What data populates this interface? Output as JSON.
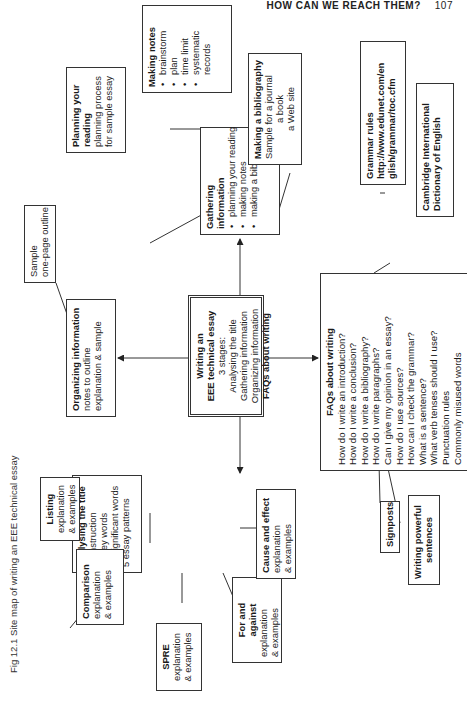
{
  "page_header": {
    "title": "HOW CAN WE REACH THEM?",
    "page_number": "107"
  },
  "figure": {
    "label": "Fig 12.1",
    "caption": "Site map of writing an EEE technical essay"
  },
  "central": {
    "title": "Writing an EEE technical essay",
    "title_line1": "Writing an",
    "title_line2": "EEE technical essay",
    "subtitle": "3 stages:",
    "stages": [
      "Analysing the title",
      "Gathering information",
      "Organizing information"
    ],
    "faq_link": "FAQs about writing"
  },
  "gathering": {
    "title": "Gathering information",
    "items": [
      "planning your reading",
      "making notes",
      "making a bibliography"
    ]
  },
  "making_notes": {
    "title": "Making notes",
    "items": [
      "brainstorm",
      "plan",
      "time limit",
      "systematic",
      "records"
    ]
  },
  "planning_reading": {
    "title_line1": "Planning your",
    "title_line2": "reading",
    "lines": [
      "planning process",
      "for sample essay"
    ]
  },
  "bibliography": {
    "title": "Making a bibliography",
    "lines": [
      "Sample for a journal",
      "a book",
      "a Web site"
    ]
  },
  "organizing": {
    "title": "Organizing information",
    "lines": [
      "notes to outline",
      "explanation & sample"
    ]
  },
  "sample_outline": {
    "lines": [
      "Sample",
      "one-page outline"
    ]
  },
  "faqs": {
    "title": "FAQs about writing",
    "items": [
      "How do I write an introduction?",
      "How do I write a conclusion?",
      "How do I write a bibliography?",
      "How do I write paragraphs?",
      "Can I give my opinion in an essay?",
      "How do I use sources?",
      "How can I check the grammar?",
      "What is a sentence?",
      "What verb tenses should I use?",
      "Punctuation rules",
      "Commonly misused words"
    ]
  },
  "grammar_rules": {
    "title": "Grammar rules",
    "url_line1": "http://www.edunet.com/en",
    "url_line2": "glish/grammar/toc.cfm"
  },
  "cambridge": {
    "line1": "Cambridge International",
    "line2": "Dictionary of English"
  },
  "signposts": {
    "title": "Signposts"
  },
  "powerful_sentences": {
    "line1": "Writing powerful",
    "line2": "sentences"
  },
  "analysing": {
    "title": "Analysing the title",
    "items": [
      "instruction",
      "key words",
      "significant words",
      "5 essay patterns"
    ]
  },
  "listing": {
    "title": "Listing",
    "lines": [
      "explanation",
      "& examples"
    ]
  },
  "comparison": {
    "title": "Comparison",
    "lines": [
      "explanation",
      "& examples"
    ]
  },
  "spre": {
    "title": "SPRE",
    "lines": [
      "explanation",
      "& examples"
    ]
  },
  "for_against": {
    "title_line1": "For and",
    "title_line2": "against",
    "lines": [
      "explanation",
      "& examples"
    ]
  },
  "cause_effect": {
    "title": "Cause and effect",
    "lines": [
      "explanation",
      "& examples"
    ]
  }
}
